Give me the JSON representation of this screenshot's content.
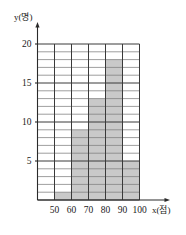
{
  "chart_data": {
    "type": "bar",
    "title": "",
    "subtitle": "",
    "xlabel": "x(점)",
    "ylabel": "y(명)",
    "grid": true,
    "legend": "none",
    "xlim": [
      40,
      100
    ],
    "ylim": [
      0,
      20
    ],
    "bin_width": 10,
    "x_tick_labels": [
      "50",
      "60",
      "70",
      "80",
      "90",
      "100"
    ],
    "x_tick_values": [
      50,
      60,
      70,
      80,
      90,
      100
    ],
    "y_tick_labels": [
      "5",
      "10",
      "15",
      "20"
    ],
    "y_tick_values": [
      5,
      10,
      15,
      20
    ],
    "y_minor_step": 1,
    "categories": [
      "40~50",
      "50~60",
      "60~70",
      "70~80",
      "80~90",
      "90~100"
    ],
    "bin_edges": [
      40,
      50,
      60,
      70,
      80,
      90,
      100
    ],
    "values": [
      0,
      1,
      9,
      13,
      18,
      5
    ],
    "bar_color": "#c9c9c9",
    "grid_color": "#7d7d7d",
    "axis_color": "#2a2a2a"
  },
  "axis_labels": {
    "y_axis_label": "y(명)",
    "x_axis_label": "x(점)"
  }
}
